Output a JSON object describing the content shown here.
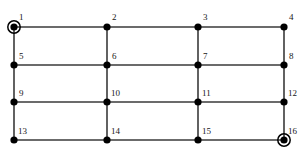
{
  "figure": {
    "kind": "grid-graph-diagram",
    "top_caption": "",
    "bottom_caption": "",
    "background_color": "#ffffff",
    "edge_color": "#3a3a3a",
    "node_color": "#000000",
    "label_color": "#171717",
    "highlight_ring_color": "#000000"
  },
  "graph": {
    "rows": 4,
    "columns": 4,
    "node_count": 16,
    "node_radius": 3.6,
    "highlight_ring_radius": 6.2,
    "column_x": [
      14,
      107,
      198,
      284
    ],
    "row_y": [
      27,
      65,
      102,
      140
    ],
    "nodes": [
      {
        "id": 1,
        "label": "1",
        "col": 0,
        "row": 0,
        "x": 14,
        "y": 27,
        "highlighted": true,
        "label_dx": 5,
        "label_dy": -14
      },
      {
        "id": 2,
        "label": "2",
        "col": 1,
        "row": 0,
        "x": 107,
        "y": 27,
        "highlighted": false,
        "label_dx": 5,
        "label_dy": -14
      },
      {
        "id": 3,
        "label": "3",
        "col": 2,
        "row": 0,
        "x": 198,
        "y": 27,
        "highlighted": false,
        "label_dx": 5,
        "label_dy": -14
      },
      {
        "id": 4,
        "label": "4",
        "col": 3,
        "row": 0,
        "x": 284,
        "y": 27,
        "highlighted": false,
        "label_dx": 5,
        "label_dy": -14
      },
      {
        "id": 5,
        "label": "5",
        "col": 0,
        "row": 1,
        "x": 14,
        "y": 65,
        "highlighted": false,
        "label_dx": 5,
        "label_dy": -13
      },
      {
        "id": 6,
        "label": "6",
        "col": 1,
        "row": 1,
        "x": 107,
        "y": 65,
        "highlighted": false,
        "label_dx": 5,
        "label_dy": -13
      },
      {
        "id": 7,
        "label": "7",
        "col": 2,
        "row": 1,
        "x": 198,
        "y": 65,
        "highlighted": false,
        "label_dx": 5,
        "label_dy": -13
      },
      {
        "id": 8,
        "label": "8",
        "col": 3,
        "row": 1,
        "x": 284,
        "y": 65,
        "highlighted": false,
        "label_dx": 5,
        "label_dy": -13
      },
      {
        "id": 9,
        "label": "9",
        "col": 0,
        "row": 2,
        "x": 14,
        "y": 102,
        "highlighted": false,
        "label_dx": 5,
        "label_dy": -13
      },
      {
        "id": 10,
        "label": "10",
        "col": 1,
        "row": 2,
        "x": 107,
        "y": 102,
        "highlighted": false,
        "label_dx": 4,
        "label_dy": -13
      },
      {
        "id": 11,
        "label": "11",
        "col": 2,
        "row": 2,
        "x": 198,
        "y": 102,
        "highlighted": false,
        "label_dx": 4,
        "label_dy": -13
      },
      {
        "id": 12,
        "label": "12",
        "col": 3,
        "row": 2,
        "x": 284,
        "y": 102,
        "highlighted": false,
        "label_dx": 4,
        "label_dy": -13
      },
      {
        "id": 13,
        "label": "13",
        "col": 0,
        "row": 3,
        "x": 14,
        "y": 140,
        "highlighted": false,
        "label_dx": 4,
        "label_dy": -13
      },
      {
        "id": 14,
        "label": "14",
        "col": 1,
        "row": 3,
        "x": 107,
        "y": 140,
        "highlighted": false,
        "label_dx": 4,
        "label_dy": -13
      },
      {
        "id": 15,
        "label": "15",
        "col": 2,
        "row": 3,
        "x": 198,
        "y": 140,
        "highlighted": false,
        "label_dx": 4,
        "label_dy": -13
      },
      {
        "id": 16,
        "label": "16",
        "col": 3,
        "row": 3,
        "x": 284,
        "y": 140,
        "highlighted": true,
        "label_dx": 4,
        "label_dy": -13
      }
    ],
    "edges": [
      {
        "from": 1,
        "to": 2,
        "orientation": "horizontal"
      },
      {
        "from": 2,
        "to": 3,
        "orientation": "horizontal"
      },
      {
        "from": 3,
        "to": 4,
        "orientation": "horizontal"
      },
      {
        "from": 5,
        "to": 6,
        "orientation": "horizontal"
      },
      {
        "from": 6,
        "to": 7,
        "orientation": "horizontal"
      },
      {
        "from": 7,
        "to": 8,
        "orientation": "horizontal"
      },
      {
        "from": 9,
        "to": 10,
        "orientation": "horizontal"
      },
      {
        "from": 10,
        "to": 11,
        "orientation": "horizontal"
      },
      {
        "from": 11,
        "to": 12,
        "orientation": "horizontal"
      },
      {
        "from": 13,
        "to": 14,
        "orientation": "horizontal"
      },
      {
        "from": 14,
        "to": 15,
        "orientation": "horizontal"
      },
      {
        "from": 15,
        "to": 16,
        "orientation": "horizontal"
      },
      {
        "from": 1,
        "to": 5,
        "orientation": "vertical"
      },
      {
        "from": 5,
        "to": 9,
        "orientation": "vertical"
      },
      {
        "from": 9,
        "to": 13,
        "orientation": "vertical"
      },
      {
        "from": 2,
        "to": 6,
        "orientation": "vertical"
      },
      {
        "from": 6,
        "to": 10,
        "orientation": "vertical"
      },
      {
        "from": 10,
        "to": 14,
        "orientation": "vertical"
      },
      {
        "from": 3,
        "to": 7,
        "orientation": "vertical"
      },
      {
        "from": 7,
        "to": 11,
        "orientation": "vertical"
      },
      {
        "from": 11,
        "to": 15,
        "orientation": "vertical"
      },
      {
        "from": 4,
        "to": 8,
        "orientation": "vertical"
      },
      {
        "from": 8,
        "to": 12,
        "orientation": "vertical"
      },
      {
        "from": 12,
        "to": 16,
        "orientation": "vertical"
      }
    ]
  }
}
